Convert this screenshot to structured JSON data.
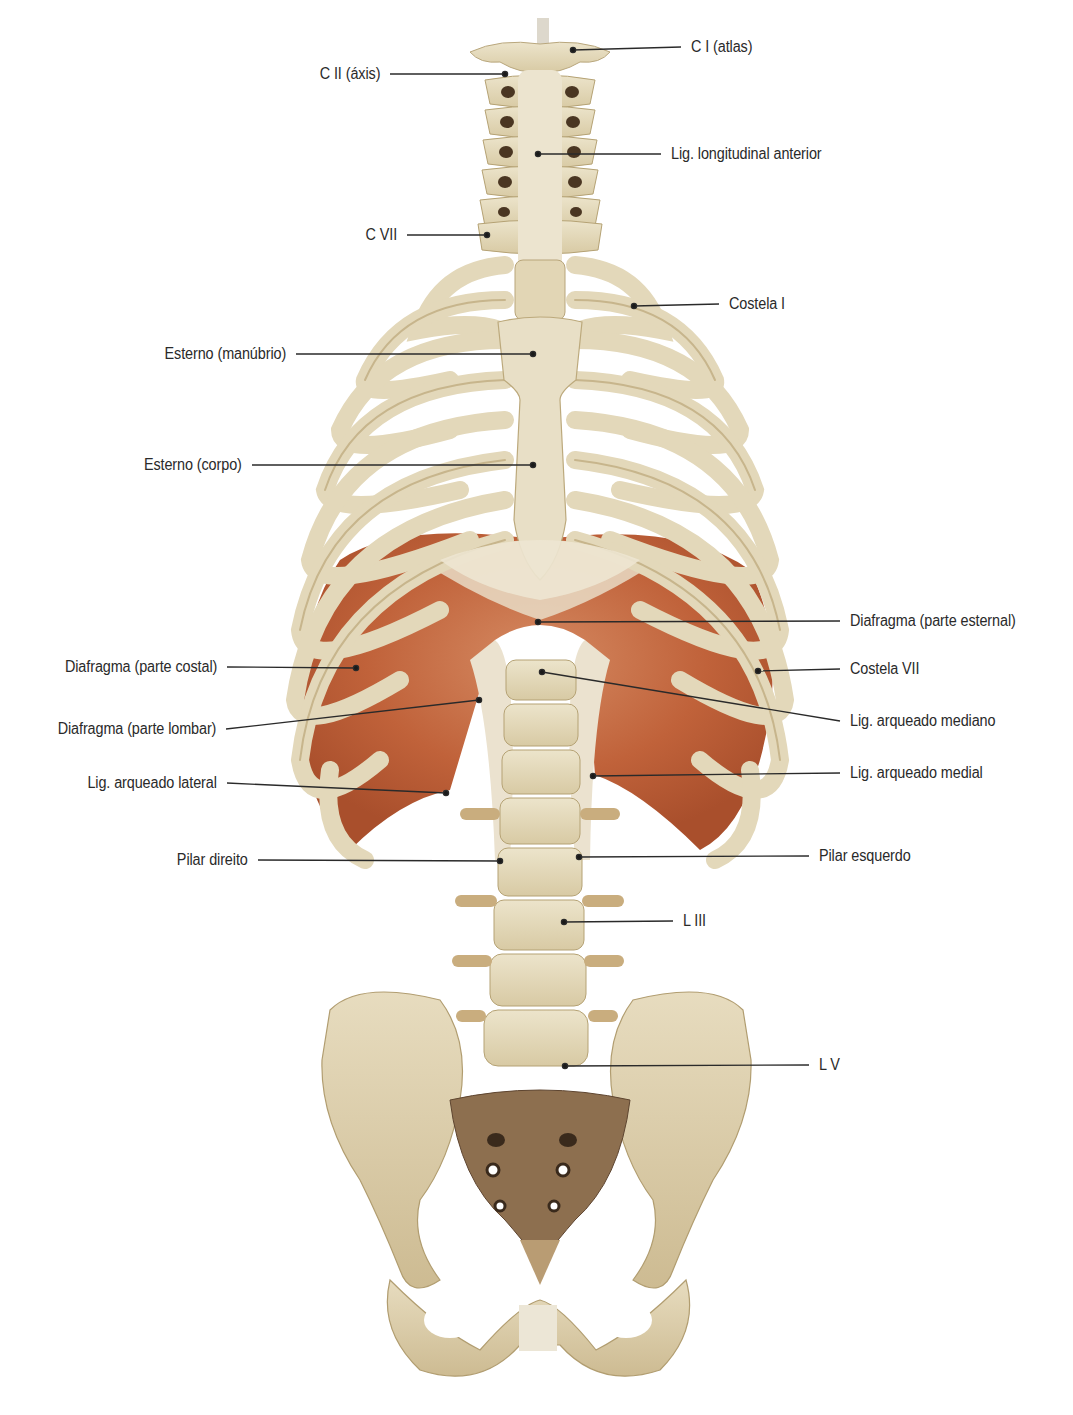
{
  "figure": {
    "type": "anatomical-illustration",
    "colors": {
      "background": "#ffffff",
      "bone": "#e6dcc0",
      "bone_shadow": "#c9b88f",
      "bone_dark": "#8c7a56",
      "muscle": "#c4683f",
      "muscle_light": "#d99a76",
      "tendon": "#ece3d3",
      "foramen": "#3a2a1c",
      "leader_line": "#2a2a2a",
      "label_text": "#2a2a2a"
    }
  },
  "labels": {
    "left": [
      {
        "id": "c2",
        "text": "C II (áxis)",
        "x_right": 380,
        "y": 74,
        "target": [
          505,
          74
        ]
      },
      {
        "id": "c7",
        "text": "C VII",
        "x_right": 397,
        "y": 235,
        "target": [
          487,
          235
        ]
      },
      {
        "id": "manubrium",
        "text": "Esterno (manúbrio)",
        "x_right": 286,
        "y": 354,
        "target": [
          533,
          354
        ]
      },
      {
        "id": "sternum_body",
        "text": "Esterno (corpo)",
        "x_right": 242,
        "y": 465,
        "target": [
          533,
          465
        ]
      },
      {
        "id": "diaph_costal",
        "text": "Diafragma (parte costal)",
        "x_right": 217,
        "y": 667,
        "target": [
          356,
          668
        ]
      },
      {
        "id": "diaph_lumbar",
        "text": "Diafragma (parte lombar)",
        "x_right": 216,
        "y": 729,
        "target": [
          479,
          700
        ]
      },
      {
        "id": "lat_arcuate",
        "text": "Lig. arqueado lateral",
        "x_right": 217,
        "y": 783,
        "target": [
          446,
          793
        ]
      },
      {
        "id": "right_crus",
        "text": "Pilar direito",
        "x_right": 248,
        "y": 860,
        "target": [
          500,
          861
        ]
      }
    ],
    "right": [
      {
        "id": "c1",
        "text": "C I (atlas)",
        "x_left": 691,
        "y": 47,
        "target": [
          573,
          50
        ]
      },
      {
        "id": "ant_long_lig",
        "text": "Lig. longitudinal anterior",
        "x_left": 671,
        "y": 154,
        "target": [
          538,
          154
        ]
      },
      {
        "id": "rib1",
        "text": "Costela I",
        "x_left": 729,
        "y": 304,
        "target": [
          634,
          306
        ]
      },
      {
        "id": "diaph_sternal",
        "text": "Diafragma (parte esternal)",
        "x_left": 850,
        "y": 621,
        "target": [
          538,
          622
        ]
      },
      {
        "id": "rib7",
        "text": "Costela VII",
        "x_left": 850,
        "y": 669,
        "target": [
          758,
          671
        ]
      },
      {
        "id": "median_arcuate",
        "text": "Lig. arqueado mediano",
        "x_left": 850,
        "y": 721,
        "target": [
          542,
          672
        ]
      },
      {
        "id": "medial_arcuate",
        "text": "Lig. arqueado medial",
        "x_left": 850,
        "y": 773,
        "target": [
          593,
          776
        ]
      },
      {
        "id": "left_crus",
        "text": "Pilar esquerdo",
        "x_left": 819,
        "y": 856,
        "target": [
          579,
          857
        ]
      },
      {
        "id": "l3",
        "text": "L III",
        "x_left": 683,
        "y": 921,
        "target": [
          564,
          922
        ]
      },
      {
        "id": "l5",
        "text": "L V",
        "x_left": 819,
        "y": 1065,
        "target": [
          565,
          1066
        ]
      }
    ]
  }
}
